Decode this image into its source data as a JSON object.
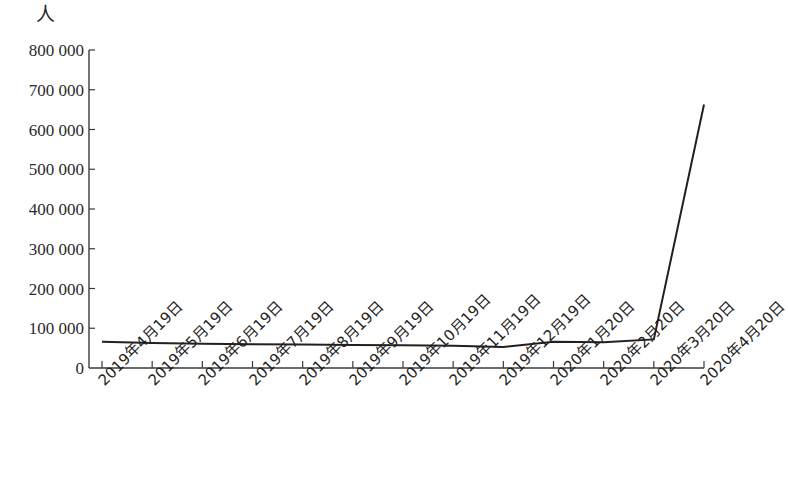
{
  "chart_data": {
    "type": "line",
    "title": "",
    "subtitle": "",
    "xlabel": "",
    "ylabel": "人",
    "unit_label": "人",
    "grid": false,
    "legend": false,
    "legend_position": "none",
    "line_color": "#231f20",
    "axis_color": "#3a3a3a",
    "ylim": [
      0,
      800000
    ],
    "ytick_step": 100000,
    "ytick_labels": [
      "800 000",
      "700 000",
      "600 000",
      "500 000",
      "400 000",
      "300 000",
      "200 000",
      "100 000",
      "0"
    ],
    "ytick_values": [
      800000,
      700000,
      600000,
      500000,
      400000,
      300000,
      200000,
      100000,
      0
    ],
    "categories": [
      "2019年4月19日",
      "2019年5月19日",
      "2019年6月19日",
      "2019年7月19日",
      "2019年8月19日",
      "2019年9月19日",
      "2019年10月19日",
      "2019年11月19日",
      "2019年12月19日",
      "2020年1月20日",
      "2020年2月20日",
      "2020年3月20日",
      "2020年4月20日"
    ],
    "series": [
      {
        "name": "人数",
        "values": [
          66000,
          63000,
          61000,
          60000,
          59000,
          58000,
          57000,
          56000,
          53000,
          66000,
          65000,
          72000,
          663000
        ]
      }
    ]
  }
}
